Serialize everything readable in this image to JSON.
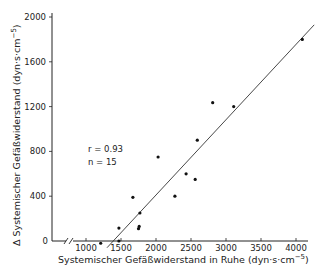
{
  "chart_data": {
    "type": "scatter",
    "title": "",
    "xlabel": "Systemischer Gefäßwiderstand in Ruhe (dyn·s·cm⁻⁵)",
    "ylabel": "Δ Systemischer Gefäßwiderstand (dyn·s·cm⁻⁵)",
    "xlim": [
      1000,
      4200
    ],
    "ylim": [
      0,
      2050
    ],
    "x_ticks": [
      1000,
      1500,
      2000,
      2500,
      3000,
      3500,
      4000
    ],
    "y_ticks": [
      0,
      400,
      800,
      1200,
      1600,
      2000
    ],
    "x_axis_break": true,
    "grid": false,
    "legend": null,
    "annotations": [
      "r = 0.93",
      "n = 15"
    ],
    "series": [
      {
        "name": "Patienten",
        "points": [
          {
            "x": 1210,
            "y": -20
          },
          {
            "x": 1470,
            "y": 0
          },
          {
            "x": 1470,
            "y": 115
          },
          {
            "x": 1670,
            "y": 390
          },
          {
            "x": 1750,
            "y": 110
          },
          {
            "x": 1760,
            "y": 130
          },
          {
            "x": 1770,
            "y": 250
          },
          {
            "x": 2030,
            "y": 750
          },
          {
            "x": 2270,
            "y": 400
          },
          {
            "x": 2430,
            "y": 600
          },
          {
            "x": 2560,
            "y": 550
          },
          {
            "x": 2590,
            "y": 900
          },
          {
            "x": 2810,
            "y": 1235
          },
          {
            "x": 3110,
            "y": 1200
          },
          {
            "x": 4090,
            "y": 1800
          }
        ]
      }
    ],
    "regression_line": {
      "x1": 1300,
      "y1": -60,
      "x2": 4260,
      "y2": 1930
    }
  },
  "labels": {
    "x_ticks": [
      "1000",
      "1500",
      "2000",
      "2500",
      "3000",
      "3500",
      "4000"
    ],
    "y_ticks": [
      "0",
      "400",
      "800",
      "1200",
      "1600",
      "2000"
    ],
    "xlabel_main": "Systemischer Gefäßwiderstand in Ruhe (dyn·s·cm",
    "xlabel_sup": "−5",
    "xlabel_close": ")",
    "ylabel_main": "Δ Systemischer Gefäßwiderstand (dyn·s·cm",
    "ylabel_sup": "−5",
    "ylabel_close": ")",
    "annot_r": "r = 0.93",
    "annot_n": "n = 15"
  }
}
